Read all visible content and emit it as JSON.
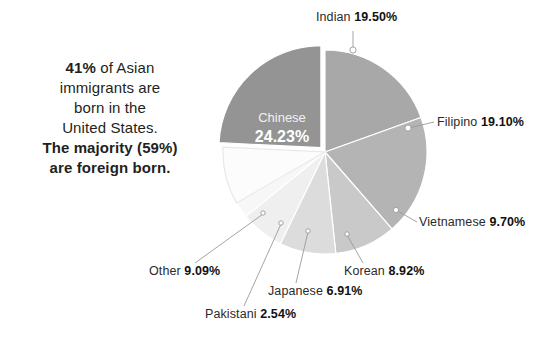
{
  "callout": {
    "line1_bold": "41%",
    "line1_rest": " of Asian",
    "line2": "immigrants are",
    "line3": "born in the",
    "line4": "United States.",
    "line5": "The majority (59%)",
    "line6": "are foreign born."
  },
  "chart_data": {
    "type": "pie",
    "title": "",
    "subtitle": "",
    "xlabel": "",
    "ylabel": "",
    "legend_position": "callout-labels",
    "grid": false,
    "value_unit": "percent",
    "categories": [
      "Chinese",
      "Indian",
      "Filipino",
      "Vietnamese",
      "Korean",
      "Japanese",
      "Pakistani",
      "Other"
    ],
    "values": [
      24.23,
      19.5,
      19.1,
      9.7,
      8.92,
      6.91,
      2.54,
      9.09
    ],
    "colors": [
      "#949494",
      "#a8a8a8",
      "#b4b4b4",
      "#c9c9c9",
      "#dcdcdc",
      "#efefef",
      "#f7f7f7",
      "#fcfcfc"
    ],
    "slices": [
      {
        "name": "Chinese",
        "value": "24.23%",
        "value_num": 24.23,
        "color": "#949494",
        "exploded": true,
        "label_placement": "inside"
      },
      {
        "name": "Indian",
        "value": "19.50%",
        "value_num": 19.5,
        "color": "#a8a8a8",
        "exploded": false,
        "label_placement": "callout"
      },
      {
        "name": "Filipino",
        "value": "19.10%",
        "value_num": 19.1,
        "color": "#b4b4b4",
        "exploded": false,
        "label_placement": "callout"
      },
      {
        "name": "Vietnamese",
        "value": "9.70%",
        "value_num": 9.7,
        "color": "#c9c9c9",
        "exploded": false,
        "label_placement": "callout"
      },
      {
        "name": "Korean",
        "value": "8.92%",
        "value_num": 8.92,
        "color": "#dcdcdc",
        "exploded": false,
        "label_placement": "callout"
      },
      {
        "name": "Japanese",
        "value": "6.91%",
        "value_num": 6.91,
        "color": "#efefef",
        "exploded": false,
        "label_placement": "callout"
      },
      {
        "name": "Pakistani",
        "value": "2.54%",
        "value_num": 2.54,
        "color": "#f7f7f7",
        "exploded": false,
        "label_placement": "callout"
      },
      {
        "name": "Other",
        "value": "9.09%",
        "value_num": 9.09,
        "color": "#fcfcfc",
        "exploded": false,
        "label_placement": "callout"
      }
    ]
  },
  "labels": {
    "indian": {
      "name": "Indian",
      "value": "19.50%"
    },
    "filipino": {
      "name": "Filipino",
      "value": "19.10%"
    },
    "vietnamese": {
      "name": "Vietnamese",
      "value": "9.70%"
    },
    "korean": {
      "name": "Korean",
      "value": "8.92%"
    },
    "japanese": {
      "name": "Japanese",
      "value": "6.91%"
    },
    "pakistani": {
      "name": "Pakistani",
      "value": "2.54%"
    },
    "other": {
      "name": "Other",
      "value": "9.09%"
    },
    "chinese": {
      "name": "Chinese",
      "value": "24.23%"
    }
  }
}
